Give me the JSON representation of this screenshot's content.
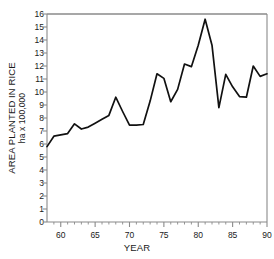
{
  "chart_data": {
    "type": "line",
    "title": "",
    "xlabel": "YEAR",
    "ylabel": "AREA PLANTED IN RICE",
    "ylabel_units": "ha x  100,000",
    "xlim": [
      58,
      90
    ],
    "ylim": [
      0,
      16
    ],
    "xticks": [
      60,
      65,
      70,
      75,
      80,
      85,
      90
    ],
    "xtick_labels": [
      "60",
      "65",
      "70",
      "75",
      "80",
      "85",
      "90"
    ],
    "xminorticks": [
      59,
      61,
      62,
      63,
      64,
      66,
      67,
      68,
      69,
      71,
      72,
      73,
      74,
      76,
      77,
      78,
      79,
      81,
      82,
      83,
      84,
      86,
      87,
      88,
      89
    ],
    "yticks": [
      0,
      1,
      2,
      3,
      4,
      5,
      6,
      7,
      8,
      9,
      10,
      11,
      12,
      13,
      14,
      15,
      16
    ],
    "ytick_labels": [
      "0",
      "1",
      "2",
      "3",
      "4",
      "5",
      "6",
      "7",
      "8",
      "9",
      "10",
      "11",
      "12",
      "13",
      "14",
      "15",
      "16"
    ],
    "grid": false,
    "legend": null,
    "line_color": "#111111",
    "axis_color": "#8a8a8a",
    "background": "#ffffff",
    "x": [
      58,
      59,
      60,
      61,
      62,
      63,
      64,
      65,
      66,
      67,
      68,
      69,
      70,
      71,
      72,
      73,
      74,
      75,
      76,
      77,
      78,
      79,
      80,
      81,
      82,
      83,
      84,
      85,
      86,
      87,
      88,
      89,
      90
    ],
    "values": [
      5.8,
      6.6,
      6.7,
      6.8,
      7.55,
      7.15,
      7.3,
      7.6,
      7.9,
      8.2,
      9.6,
      8.5,
      7.45,
      7.45,
      7.5,
      9.3,
      11.4,
      11.05,
      9.25,
      10.2,
      12.15,
      11.95,
      13.6,
      15.6,
      13.6,
      8.8,
      11.35,
      10.4,
      9.65,
      9.6,
      12.0,
      11.2,
      11.4
    ],
    "series_name": "Area planted in rice"
  },
  "axes": {
    "xlabel": "YEAR",
    "ylabel_line1": "AREA PLANTED IN RICE",
    "ylabel_line2": "ha x  100,000"
  }
}
